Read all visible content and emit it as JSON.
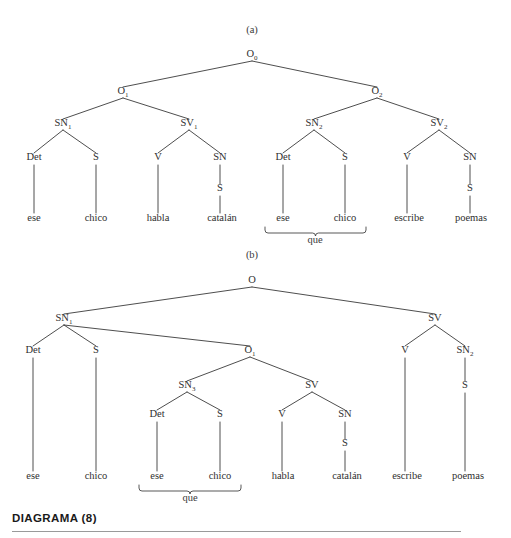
{
  "page": {
    "width": 511,
    "height": 538,
    "background": "#ffffff",
    "ink": "#2f2f2f",
    "rule_color": "#9a9a9a"
  },
  "caption": {
    "text": "DIAGRAMA (8)",
    "rule_visible": true
  },
  "panels": [
    {
      "id": "panel-a",
      "label": "(a)",
      "label_x": 252,
      "label_y": 33,
      "nodes": [
        {
          "id": "a-O0",
          "text": "O",
          "sub": "0",
          "x": 252,
          "y": 57
        },
        {
          "id": "a-O1",
          "text": "O",
          "sub": "1",
          "x": 123,
          "y": 94
        },
        {
          "id": "a-O2",
          "text": "O",
          "sub": "2",
          "x": 377,
          "y": 94
        },
        {
          "id": "a-SN1",
          "text": "SN",
          "sub": "1",
          "x": 63,
          "y": 126
        },
        {
          "id": "a-SV1",
          "text": "SV",
          "sub": "1",
          "x": 189,
          "y": 126
        },
        {
          "id": "a-SN2",
          "text": "SN",
          "sub": "2",
          "x": 314,
          "y": 126
        },
        {
          "id": "a-SV2",
          "text": "SV",
          "sub": "2",
          "x": 439,
          "y": 126
        },
        {
          "id": "a-Det1",
          "text": "Det",
          "sub": "",
          "x": 34,
          "y": 160
        },
        {
          "id": "a-S1",
          "text": "S",
          "sub": "",
          "x": 96,
          "y": 160
        },
        {
          "id": "a-V1",
          "text": "V",
          "sub": "",
          "x": 158,
          "y": 160
        },
        {
          "id": "a-SN3",
          "text": "SN",
          "sub": "",
          "x": 220,
          "y": 160
        },
        {
          "id": "a-Det2",
          "text": "Det",
          "sub": "",
          "x": 283,
          "y": 160
        },
        {
          "id": "a-S2",
          "text": "S",
          "sub": "",
          "x": 345,
          "y": 160
        },
        {
          "id": "a-V2",
          "text": "V",
          "sub": "",
          "x": 407,
          "y": 160
        },
        {
          "id": "a-SN4",
          "text": "SN",
          "sub": "",
          "x": 470,
          "y": 160
        },
        {
          "id": "a-Sx1",
          "text": "S",
          "sub": "",
          "x": 220,
          "y": 191
        },
        {
          "id": "a-Sx2",
          "text": "S",
          "sub": "",
          "x": 470,
          "y": 191
        }
      ],
      "leaves": [
        {
          "id": "a-l1",
          "text": "ese",
          "x": 34,
          "y": 221
        },
        {
          "id": "a-l2",
          "text": "chico",
          "x": 96,
          "y": 221
        },
        {
          "id": "a-l3",
          "text": "habla",
          "x": 158,
          "y": 221
        },
        {
          "id": "a-l4",
          "text": "catalán",
          "x": 222,
          "y": 221
        },
        {
          "id": "a-l5",
          "text": "ese",
          "x": 283,
          "y": 221
        },
        {
          "id": "a-l6",
          "text": "chico",
          "x": 345,
          "y": 221
        },
        {
          "id": "a-l7",
          "text": "escribe",
          "x": 409,
          "y": 221
        },
        {
          "id": "a-l8",
          "text": "poemas",
          "x": 471,
          "y": 221
        }
      ],
      "edges": [
        {
          "x1": 252,
          "y1": 61,
          "x2": 123,
          "y2": 87
        },
        {
          "x1": 252,
          "y1": 61,
          "x2": 377,
          "y2": 87
        },
        {
          "x1": 123,
          "y1": 98,
          "x2": 63,
          "y2": 119
        },
        {
          "x1": 123,
          "y1": 98,
          "x2": 189,
          "y2": 119
        },
        {
          "x1": 377,
          "y1": 98,
          "x2": 314,
          "y2": 119
        },
        {
          "x1": 377,
          "y1": 98,
          "x2": 439,
          "y2": 119
        },
        {
          "x1": 63,
          "y1": 130,
          "x2": 34,
          "y2": 153
        },
        {
          "x1": 63,
          "y1": 130,
          "x2": 96,
          "y2": 153
        },
        {
          "x1": 189,
          "y1": 130,
          "x2": 158,
          "y2": 153
        },
        {
          "x1": 189,
          "y1": 130,
          "x2": 220,
          "y2": 153
        },
        {
          "x1": 314,
          "y1": 130,
          "x2": 283,
          "y2": 153
        },
        {
          "x1": 314,
          "y1": 130,
          "x2": 345,
          "y2": 153
        },
        {
          "x1": 439,
          "y1": 130,
          "x2": 407,
          "y2": 153
        },
        {
          "x1": 439,
          "y1": 130,
          "x2": 470,
          "y2": 153
        },
        {
          "x1": 34,
          "y1": 165,
          "x2": 34,
          "y2": 213
        },
        {
          "x1": 96,
          "y1": 165,
          "x2": 96,
          "y2": 213
        },
        {
          "x1": 158,
          "y1": 165,
          "x2": 158,
          "y2": 213
        },
        {
          "x1": 220,
          "y1": 165,
          "x2": 220,
          "y2": 184
        },
        {
          "x1": 220,
          "y1": 196,
          "x2": 220,
          "y2": 213
        },
        {
          "x1": 283,
          "y1": 165,
          "x2": 283,
          "y2": 213
        },
        {
          "x1": 345,
          "y1": 165,
          "x2": 345,
          "y2": 213
        },
        {
          "x1": 407,
          "y1": 165,
          "x2": 407,
          "y2": 213
        },
        {
          "x1": 470,
          "y1": 165,
          "x2": 470,
          "y2": 184
        },
        {
          "x1": 470,
          "y1": 196,
          "x2": 470,
          "y2": 213
        }
      ],
      "braces": [
        {
          "id": "a-brace-que",
          "label": "que",
          "left": 265,
          "right": 366,
          "top": 227,
          "depth": 6,
          "label_x": 315,
          "label_y": 243
        }
      ]
    },
    {
      "id": "panel-b",
      "label": "(b)",
      "label_x": 252,
      "label_y": 258,
      "nodes": [
        {
          "id": "b-O",
          "text": "O",
          "sub": "",
          "x": 252,
          "y": 283
        },
        {
          "id": "b-SN1",
          "text": "SN",
          "sub": "1",
          "x": 64,
          "y": 321
        },
        {
          "id": "b-SV",
          "text": "SV",
          "sub": "",
          "x": 435,
          "y": 321
        },
        {
          "id": "b-Det1",
          "text": "Det",
          "sub": "",
          "x": 33,
          "y": 353
        },
        {
          "id": "b-S1",
          "text": "S",
          "sub": "",
          "x": 96,
          "y": 353
        },
        {
          "id": "b-O1",
          "text": "O",
          "sub": "1",
          "x": 250,
          "y": 353
        },
        {
          "id": "b-V2",
          "text": "V",
          "sub": "",
          "x": 405,
          "y": 353
        },
        {
          "id": "b-SN2",
          "text": "SN",
          "sub": "2",
          "x": 465,
          "y": 353
        },
        {
          "id": "b-SN3",
          "text": "SN",
          "sub": "3",
          "x": 187,
          "y": 388
        },
        {
          "id": "b-SVi",
          "text": "SV",
          "sub": "",
          "x": 312,
          "y": 388
        },
        {
          "id": "b-Sx2",
          "text": "S",
          "sub": "",
          "x": 465,
          "y": 388
        },
        {
          "id": "b-Det2",
          "text": "Det",
          "sub": "",
          "x": 157,
          "y": 417
        },
        {
          "id": "b-S2",
          "text": "S",
          "sub": "",
          "x": 220,
          "y": 417
        },
        {
          "id": "b-V1",
          "text": "V",
          "sub": "",
          "x": 282,
          "y": 417
        },
        {
          "id": "b-SNx",
          "text": "SN",
          "sub": "",
          "x": 345,
          "y": 417
        },
        {
          "id": "b-Sx1",
          "text": "S",
          "sub": "",
          "x": 345,
          "y": 446
        }
      ],
      "leaves": [
        {
          "id": "b-l1",
          "text": "ese",
          "x": 33,
          "y": 479
        },
        {
          "id": "b-l2",
          "text": "chico",
          "x": 96,
          "y": 479
        },
        {
          "id": "b-l3",
          "text": "ese",
          "x": 157,
          "y": 479
        },
        {
          "id": "b-l4",
          "text": "chico",
          "x": 220,
          "y": 479
        },
        {
          "id": "b-l5",
          "text": "habla",
          "x": 283,
          "y": 479
        },
        {
          "id": "b-l6",
          "text": "catalán",
          "x": 347,
          "y": 479
        },
        {
          "id": "b-l7",
          "text": "escribe",
          "x": 407,
          "y": 479
        },
        {
          "id": "b-l8",
          "text": "poemas",
          "x": 468,
          "y": 479
        }
      ],
      "edges": [
        {
          "x1": 252,
          "y1": 287,
          "x2": 64,
          "y2": 314
        },
        {
          "x1": 252,
          "y1": 287,
          "x2": 435,
          "y2": 314
        },
        {
          "x1": 64,
          "y1": 325,
          "x2": 33,
          "y2": 346
        },
        {
          "x1": 64,
          "y1": 325,
          "x2": 96,
          "y2": 346
        },
        {
          "x1": 64,
          "y1": 325,
          "x2": 250,
          "y2": 346
        },
        {
          "x1": 435,
          "y1": 325,
          "x2": 405,
          "y2": 346
        },
        {
          "x1": 435,
          "y1": 325,
          "x2": 465,
          "y2": 346
        },
        {
          "x1": 250,
          "y1": 357,
          "x2": 187,
          "y2": 381
        },
        {
          "x1": 250,
          "y1": 357,
          "x2": 312,
          "y2": 381
        },
        {
          "x1": 187,
          "y1": 392,
          "x2": 157,
          "y2": 410
        },
        {
          "x1": 187,
          "y1": 392,
          "x2": 220,
          "y2": 410
        },
        {
          "x1": 312,
          "y1": 392,
          "x2": 282,
          "y2": 410
        },
        {
          "x1": 312,
          "y1": 392,
          "x2": 345,
          "y2": 410
        },
        {
          "x1": 33,
          "y1": 358,
          "x2": 33,
          "y2": 471
        },
        {
          "x1": 96,
          "y1": 358,
          "x2": 96,
          "y2": 471
        },
        {
          "x1": 157,
          "y1": 422,
          "x2": 157,
          "y2": 471
        },
        {
          "x1": 220,
          "y1": 422,
          "x2": 220,
          "y2": 471
        },
        {
          "x1": 282,
          "y1": 422,
          "x2": 282,
          "y2": 471
        },
        {
          "x1": 345,
          "y1": 422,
          "x2": 345,
          "y2": 439
        },
        {
          "x1": 345,
          "y1": 451,
          "x2": 345,
          "y2": 471
        },
        {
          "x1": 465,
          "y1": 358,
          "x2": 465,
          "y2": 381
        },
        {
          "x1": 465,
          "y1": 393,
          "x2": 465,
          "y2": 471
        },
        {
          "x1": 405,
          "y1": 358,
          "x2": 405,
          "y2": 471
        }
      ],
      "braces": [
        {
          "id": "b-brace-que",
          "label": "que",
          "left": 139,
          "right": 241,
          "top": 485,
          "depth": 6,
          "label_x": 190,
          "label_y": 501
        }
      ]
    }
  ]
}
